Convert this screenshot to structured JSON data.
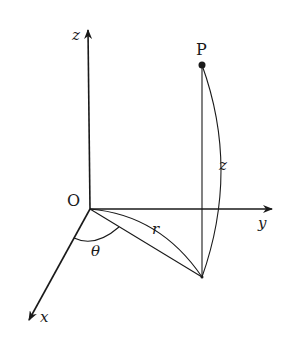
{
  "diagram": {
    "colors": {
      "ink": "#1a1a1a",
      "background": "#ffffff"
    },
    "points": {
      "origin": {
        "label": "O",
        "x": 90,
        "y": 209
      },
      "P": {
        "label": "P",
        "x": 202,
        "y": 65
      },
      "projection": {
        "label": "",
        "x": 202,
        "y": 277
      }
    },
    "axes": [
      {
        "name": "z",
        "label": "z",
        "from": [
          90,
          209
        ],
        "to": [
          88,
          28
        ]
      },
      {
        "name": "y",
        "label": "y",
        "from": [
          90,
          209
        ],
        "to": [
          274,
          209
        ]
      },
      {
        "name": "x",
        "label": "x",
        "from": [
          90,
          209
        ],
        "to": [
          28,
          322
        ]
      }
    ],
    "labels": {
      "origin": "O",
      "point": "P",
      "z_axis": "z",
      "y_axis": "y",
      "x_axis": "x",
      "radius": "r",
      "angle": "θ",
      "height": "z"
    }
  }
}
